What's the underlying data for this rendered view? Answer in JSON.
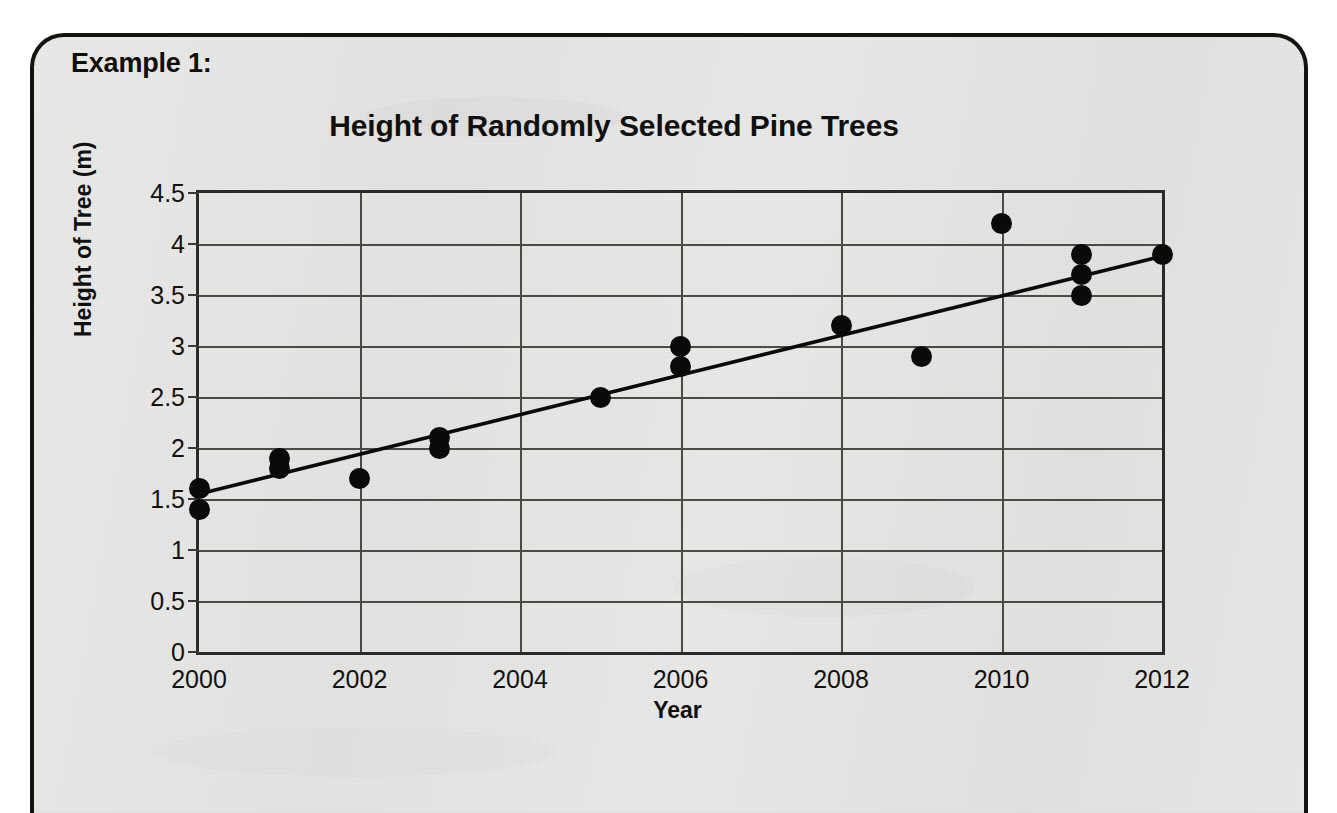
{
  "worksheet": {
    "example_label": "Example 1:"
  },
  "chart_data": {
    "type": "scatter",
    "title": "Height of Randomly Selected Pine Trees",
    "xlabel": "Year",
    "ylabel": "Height of Tree (m)",
    "xlim": [
      2000,
      2012
    ],
    "ylim": [
      0,
      4.5
    ],
    "grid": true,
    "legend": "none",
    "xticks": [
      "2000",
      "2002",
      "2004",
      "2006",
      "2008",
      "2010",
      "2012"
    ],
    "xtick_values": [
      2000,
      2002,
      2004,
      2006,
      2008,
      2010,
      2012
    ],
    "yticks": [
      "0",
      "0.5",
      "1",
      "1.5",
      "2",
      "2.5",
      "3",
      "3.5",
      "4",
      "4.5"
    ],
    "ytick_values": [
      0,
      0.5,
      1,
      1.5,
      2,
      2.5,
      3,
      3.5,
      4,
      4.5
    ],
    "points": [
      {
        "x": 2000,
        "y": 1.6
      },
      {
        "x": 2000,
        "y": 1.4
      },
      {
        "x": 2001,
        "y": 1.9
      },
      {
        "x": 2001,
        "y": 1.8
      },
      {
        "x": 2002,
        "y": 1.7
      },
      {
        "x": 2003,
        "y": 2.1
      },
      {
        "x": 2003,
        "y": 2.0
      },
      {
        "x": 2005,
        "y": 2.5
      },
      {
        "x": 2006,
        "y": 3.0
      },
      {
        "x": 2006,
        "y": 2.8
      },
      {
        "x": 2008,
        "y": 3.2
      },
      {
        "x": 2009,
        "y": 2.9
      },
      {
        "x": 2010,
        "y": 4.2
      },
      {
        "x": 2011,
        "y": 3.9
      },
      {
        "x": 2011,
        "y": 3.7
      },
      {
        "x": 2011,
        "y": 3.5
      },
      {
        "x": 2012,
        "y": 3.9
      }
    ],
    "trendline": {
      "name": "line of best fit",
      "x_start": 2000,
      "y_start": 1.55,
      "x_end": 2012,
      "y_end": 3.88
    },
    "colors": {
      "marker": "#0b0a09",
      "trendline": "#0b0a09",
      "grid": "#4c4a47",
      "background": "#e8e8e7"
    }
  }
}
